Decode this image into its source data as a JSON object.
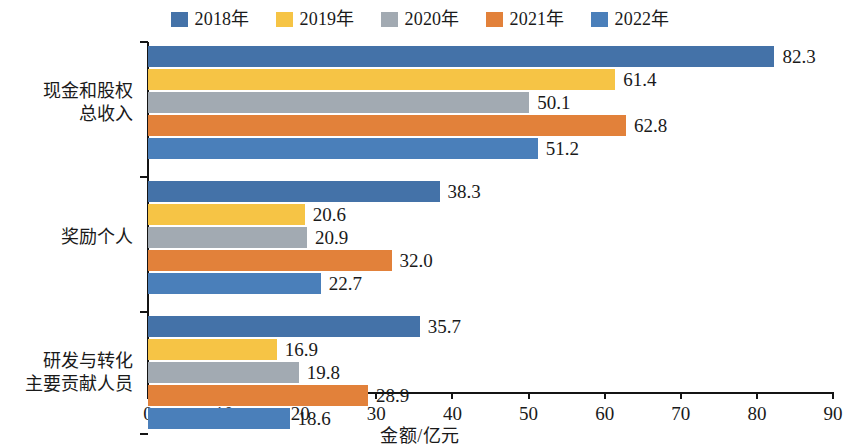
{
  "chart_data": {
    "type": "bar",
    "orientation": "horizontal",
    "title": "",
    "xlabel": "金额/亿元",
    "ylabel": "",
    "xlim": [
      0,
      90
    ],
    "xticks": [
      0,
      10,
      20,
      30,
      40,
      50,
      60,
      70,
      80,
      90
    ],
    "grid": false,
    "legend_position": "top-center",
    "categories": [
      "现金和股权\n总收入",
      "奖励个人",
      "研发与转化\n主要贡献人员"
    ],
    "series": [
      {
        "name": "2018年",
        "color": "#4472a8",
        "values": [
          82.3,
          38.3,
          35.7
        ]
      },
      {
        "name": "2019年",
        "color": "#f6c445",
        "values": [
          61.4,
          20.6,
          16.9
        ]
      },
      {
        "name": "2020年",
        "color": "#a2aab2",
        "values": [
          50.1,
          20.9,
          19.8
        ]
      },
      {
        "name": "2021年",
        "color": "#e2813a",
        "values": [
          62.8,
          32.0,
          28.9
        ]
      },
      {
        "name": "2022年",
        "color": "#4a7fba",
        "values": [
          51.2,
          22.7,
          18.6
        ]
      }
    ],
    "data_labels": [
      [
        "82.3",
        "61.4",
        "50.1",
        "62.8",
        "51.2"
      ],
      [
        "38.3",
        "20.6",
        "20.9",
        "32.0",
        "22.7"
      ],
      [
        "35.7",
        "16.9",
        "19.8",
        "28.9",
        "18.6"
      ]
    ],
    "axis_color": "#141414"
  }
}
